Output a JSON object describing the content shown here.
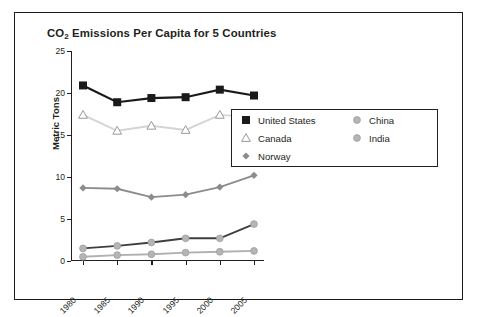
{
  "chart_data": {
    "type": "line",
    "title": "CO2 Emissions Per Capita for 5 Countries",
    "title_main": "CO",
    "title_sub": "2",
    "title_rest": " Emissions Per Capita for 5 Countries",
    "xlabel": "",
    "ylabel": "Metric Tons",
    "x": [
      1980,
      1985,
      1990,
      1995,
      2000,
      2005
    ],
    "categories": [
      "1980",
      "1985",
      "1990",
      "1995",
      "2000",
      "2005"
    ],
    "ylim": [
      0,
      25
    ],
    "yticks": [
      0,
      5,
      10,
      15,
      20,
      25
    ],
    "ytick_labels": [
      "0",
      "5",
      "10",
      "15",
      "20",
      "25"
    ],
    "grid": false,
    "legend_position": "right-middle",
    "series": [
      {
        "name": "United States",
        "values": [
          20.9,
          18.9,
          19.4,
          19.5,
          20.4,
          19.7
        ],
        "color": "#1a1a1a",
        "marker": "square-filled",
        "marker_color": "#1a1a1a"
      },
      {
        "name": "Canada",
        "values": [
          17.4,
          15.5,
          16.1,
          15.6,
          17.4,
          17.1
        ],
        "color": "#d4d4d4",
        "marker": "triangle-open",
        "marker_color": "#9a9a9a"
      },
      {
        "name": "Norway",
        "values": [
          8.7,
          8.6,
          7.6,
          7.9,
          8.8,
          10.2
        ],
        "color": "#8c8c8c",
        "marker": "diamond-filled",
        "marker_color": "#8c8c8c"
      },
      {
        "name": "China",
        "values": [
          1.5,
          1.8,
          2.2,
          2.7,
          2.7,
          4.4
        ],
        "color": "#3f3f3f",
        "marker": "circle-filled",
        "marker_color": "#b5b5b5"
      },
      {
        "name": "India",
        "values": [
          0.5,
          0.7,
          0.8,
          1.0,
          1.1,
          1.2
        ],
        "color": "#b0b0b0",
        "marker": "circle-filled",
        "marker_color": "#b5b5b5"
      }
    ]
  },
  "legend": {
    "items": [
      {
        "label": "United States"
      },
      {
        "label": "Canada"
      },
      {
        "label": "Norway"
      },
      {
        "label": "China"
      },
      {
        "label": "India"
      }
    ]
  },
  "colors": {
    "frame": "#1a1a1a",
    "axis": "#231f20",
    "text": "#231f20",
    "background": "#ffffff"
  }
}
